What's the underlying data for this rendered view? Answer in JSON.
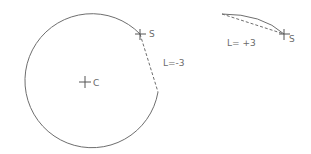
{
  "diagram": {
    "left_figure": {
      "center_label": "C",
      "start_label": "S",
      "length_label": "L=-3",
      "circle": {
        "cx": 85,
        "cy": 81,
        "r": 67
      },
      "start_point": {
        "x": 140,
        "y": 34
      },
      "end_point": {
        "x": 158,
        "y": 92
      }
    },
    "right_figure": {
      "start_label": "S",
      "length_label": "L= +3",
      "arc_start": {
        "x": 222,
        "y": 14
      },
      "start_point": {
        "x": 284,
        "y": 34
      }
    },
    "colors": {
      "line": "#6e6e6e",
      "text": "#6a6a6a"
    }
  }
}
